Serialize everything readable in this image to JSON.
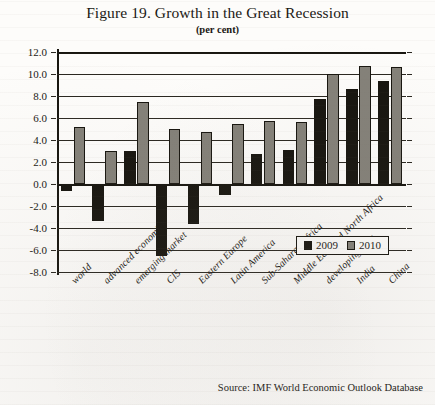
{
  "figure": {
    "title": "Figure 19. Growth in the Great Recession",
    "subtitle": "(per cent)",
    "source": "Source: IMF World Economic Outlook Database"
  },
  "legend": {
    "items": [
      {
        "label": "2009",
        "color": "#17150f"
      },
      {
        "label": "2010",
        "color": "#848179"
      }
    ]
  },
  "chart_data": {
    "type": "bar",
    "title": "Figure 19. Growth in the Great Recession",
    "subtitle": "(per cent)",
    "xlabel": "",
    "ylabel": "per cent",
    "ylim": [
      -8.0,
      12.0
    ],
    "yticks": [
      "12.0",
      "10.0",
      "8.0",
      "6.0",
      "4.0",
      "2.0",
      "0.0",
      "-2.0",
      "-4.0",
      "-6.0",
      "-8.0"
    ],
    "ytick_values": [
      12.0,
      10.0,
      8.0,
      6.0,
      4.0,
      2.0,
      0.0,
      -2.0,
      -4.0,
      -6.0,
      -8.0
    ],
    "grid": true,
    "legend_position": "bottom-right",
    "categories": [
      "world",
      "advanced economies",
      "emerging market",
      "CIS",
      "Eastern Europe",
      "Latin America",
      "Sub-Saharan Africa",
      "Middle East and North Africa",
      "developing Asia",
      "India",
      "China"
    ],
    "series": [
      {
        "name": "2009",
        "color": "#17150f",
        "values": [
          -0.6,
          -3.4,
          3.0,
          -6.5,
          -3.6,
          -1.0,
          2.7,
          3.1,
          7.7,
          8.6,
          9.4
        ]
      },
      {
        "name": "2010",
        "color": "#848179",
        "values": [
          5.2,
          3.0,
          7.5,
          5.0,
          4.7,
          5.5,
          5.7,
          5.6,
          10.0,
          10.7,
          10.6
        ]
      }
    ],
    "source": "Source: IMF World Economic Outlook Database"
  }
}
